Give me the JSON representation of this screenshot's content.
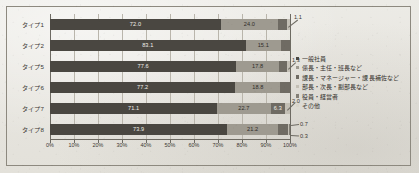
{
  "chart_data": {
    "type": "bar",
    "subtype": "stacked-100-horizontal",
    "title": "",
    "xlabel": "",
    "ylabel": "",
    "xlim": [
      0,
      100
    ],
    "grid": true,
    "legend_position": "right",
    "categories": [
      "タイプ1",
      "タイプ2",
      "タイプ5",
      "タイプ6",
      "タイプ7",
      "タイプ8"
    ],
    "xticks": [
      "0%",
      "10%",
      "20%",
      "30%",
      "40%",
      "50%",
      "60%",
      "70%",
      "80%",
      "90%",
      "100%"
    ],
    "xtick_values": [
      0,
      10,
      20,
      30,
      40,
      50,
      60,
      70,
      80,
      90,
      100
    ],
    "series": [
      {
        "name": "一般社員",
        "color": "#4a4741",
        "values": [
          72.0,
          83.1,
          77.6,
          77.2,
          71.1,
          73.9
        ]
      },
      {
        "name": "係長・主任・班長など",
        "color": "#9e9a90",
        "values": [
          24.0,
          15.1,
          17.8,
          18.8,
          22.7,
          21.2
        ]
      },
      {
        "name": "課長・マネージャー・課長補佐など",
        "color": "#6f6b63",
        "values": [
          4.0,
          3.8,
          3.3,
          4.0,
          6.3,
          4.0
        ]
      },
      {
        "name": "部長・次長・副部長など",
        "color": "#c3bfb5",
        "values": [
          1.1,
          0.0,
          1.3,
          0.0,
          2.0,
          0.7
        ]
      },
      {
        "name": "役員・経営者",
        "color": "#837f76",
        "values": [
          0.0,
          0.0,
          0.0,
          0.0,
          0.0,
          0.3
        ]
      },
      {
        "name": "その他",
        "color": "#d8d4ca",
        "values": [
          0.0,
          0.0,
          0.0,
          0.0,
          0.0,
          0.0
        ]
      }
    ],
    "callouts": [
      {
        "row": 0,
        "label": "1.1"
      },
      {
        "row": 2,
        "label": "1.3"
      },
      {
        "row": 4,
        "label": "2.0"
      },
      {
        "row": 5,
        "label": "0.7"
      },
      {
        "row": 5,
        "label": "0.3"
      }
    ]
  }
}
